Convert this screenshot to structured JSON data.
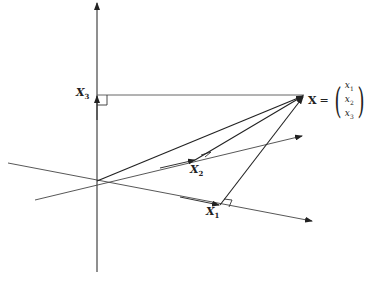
{
  "diagram": {
    "type": "3d-vector-decomposition",
    "labels": {
      "x1": "X",
      "x1_sub": "1",
      "x2": "X",
      "x2_sub": "2",
      "x3": "X",
      "x3_sub": "3",
      "vector_name": "X",
      "equals": "=",
      "components": [
        {
          "base": "x",
          "sub": "1"
        },
        {
          "base": "x",
          "sub": "2"
        },
        {
          "base": "x",
          "sub": "3"
        }
      ]
    },
    "geometry": {
      "origin": [
        97,
        181
      ],
      "point_X": [
        304,
        95
      ],
      "point_X1": [
        220,
        205
      ],
      "point_X2": [
        195,
        160
      ],
      "point_X3": [
        97,
        95
      ]
    },
    "colors": {
      "line": "#333333",
      "projection": "#666666"
    }
  }
}
